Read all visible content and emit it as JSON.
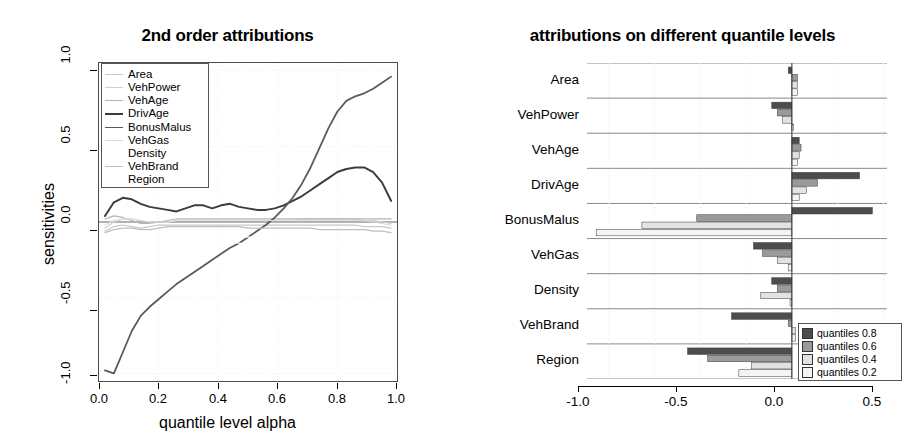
{
  "left": {
    "title": "2nd order attributions",
    "ylabel": "sensitivities",
    "xlabel": "quantile level alpha",
    "yticks": [
      "1.0",
      "0.5",
      "0.0",
      "-0.5",
      "-1.0"
    ],
    "xticks": [
      "0.0",
      "0.2",
      "0.4",
      "0.6",
      "0.8",
      "1.0"
    ],
    "legend": [
      {
        "label": "Area",
        "color": "#c8c8c8",
        "width": 1.2
      },
      {
        "label": "VehPower",
        "color": "#d2d2d2",
        "width": 1.2
      },
      {
        "label": "VehAge",
        "color": "#b4b4b4",
        "width": 1.2
      },
      {
        "label": "DrivAge",
        "color": "#3c3c3c",
        "width": 2.0
      },
      {
        "label": "BonusMalus",
        "color": "#5a5a5a",
        "width": 1.8
      },
      {
        "label": "VehGas",
        "color": "#dcdcdc",
        "width": 1.2
      },
      {
        "label": "Density",
        "color": "#ffffff",
        "width": 1.2
      },
      {
        "label": "VehBrand",
        "color": "#bebebe",
        "width": 1.2
      },
      {
        "label": "Region",
        "color": "#ffffff",
        "width": 1.2
      }
    ]
  },
  "right": {
    "title": "attributions on different quantile levels",
    "xticks": [
      "-1.0",
      "-0.5",
      "0.0",
      "0.5"
    ],
    "categories": [
      "Area",
      "VehPower",
      "VehAge",
      "DrivAge",
      "BonusMalus",
      "VehGas",
      "Density",
      "VehBrand",
      "Region"
    ],
    "legend": [
      {
        "label": "quantiles 0.8",
        "color": "#4d4d4d"
      },
      {
        "label": "quantiles 0.6",
        "color": "#9a9a9a"
      },
      {
        "label": "quantiles 0.4",
        "color": "#e2e2e2"
      },
      {
        "label": "quantiles 0.2",
        "color": "#f4f4f4"
      }
    ]
  },
  "chart_data": [
    {
      "type": "line",
      "title": "2nd order attributions",
      "xlabel": "quantile level alpha",
      "ylabel": "sensitivities",
      "xlim": [
        0.0,
        1.0
      ],
      "ylim": [
        -1.05,
        1.05
      ],
      "grid": true,
      "legend_position": "top-left",
      "x": [
        0.02,
        0.05,
        0.08,
        0.11,
        0.14,
        0.17,
        0.2,
        0.23,
        0.26,
        0.29,
        0.32,
        0.35,
        0.38,
        0.41,
        0.44,
        0.47,
        0.5,
        0.53,
        0.56,
        0.59,
        0.62,
        0.65,
        0.68,
        0.71,
        0.74,
        0.77,
        0.8,
        0.83,
        0.86,
        0.89,
        0.92,
        0.95,
        0.98
      ],
      "series": [
        {
          "name": "Area",
          "values": [
            -0.06,
            -0.03,
            -0.02,
            -0.03,
            -0.04,
            -0.03,
            -0.02,
            -0.02,
            -0.02,
            -0.02,
            -0.02,
            -0.02,
            -0.02,
            -0.02,
            -0.02,
            -0.02,
            -0.02,
            -0.02,
            -0.02,
            -0.02,
            -0.02,
            -0.02,
            -0.02,
            -0.02,
            -0.02,
            -0.02,
            -0.02,
            -0.02,
            -0.02,
            -0.03,
            -0.03,
            -0.03,
            -0.04
          ]
        },
        {
          "name": "VehPower",
          "values": [
            -0.04,
            0.0,
            0.02,
            0.02,
            0.01,
            0.0,
            0.0,
            0.0,
            0.01,
            0.01,
            0.01,
            0.01,
            0.01,
            0.01,
            0.01,
            0.01,
            0.01,
            0.01,
            0.01,
            0.01,
            0.01,
            0.01,
            0.02,
            0.02,
            0.02,
            0.02,
            0.02,
            0.02,
            0.02,
            0.01,
            0.01,
            0.0,
            -0.01
          ]
        },
        {
          "name": "VehAge",
          "values": [
            0.02,
            0.04,
            0.03,
            0.01,
            -0.01,
            -0.01,
            0.0,
            0.01,
            0.02,
            0.02,
            0.02,
            0.02,
            0.02,
            0.02,
            0.02,
            0.02,
            0.02,
            0.02,
            0.02,
            0.02,
            0.02,
            0.02,
            0.02,
            0.02,
            0.02,
            0.02,
            0.02,
            0.02,
            0.02,
            0.02,
            0.02,
            0.02,
            0.02
          ]
        },
        {
          "name": "DrivAge",
          "values": [
            0.04,
            0.13,
            0.16,
            0.15,
            0.12,
            0.1,
            0.09,
            0.08,
            0.07,
            0.09,
            0.11,
            0.11,
            0.09,
            0.11,
            0.12,
            0.1,
            0.09,
            0.08,
            0.08,
            0.09,
            0.11,
            0.14,
            0.17,
            0.21,
            0.25,
            0.29,
            0.33,
            0.35,
            0.36,
            0.36,
            0.33,
            0.26,
            0.14
          ]
        },
        {
          "name": "BonusMalus",
          "values": [
            -0.98,
            -1.0,
            -0.86,
            -0.72,
            -0.62,
            -0.56,
            -0.51,
            -0.46,
            -0.41,
            -0.37,
            -0.33,
            -0.29,
            -0.25,
            -0.21,
            -0.17,
            -0.14,
            -0.1,
            -0.06,
            -0.02,
            0.03,
            0.09,
            0.16,
            0.25,
            0.36,
            0.49,
            0.62,
            0.73,
            0.8,
            0.83,
            0.85,
            0.88,
            0.92,
            0.96
          ]
        },
        {
          "name": "VehGas",
          "values": [
            -0.02,
            0.01,
            0.02,
            0.02,
            0.01,
            0.0,
            0.0,
            0.0,
            0.01,
            0.01,
            0.01,
            0.01,
            0.01,
            0.01,
            0.01,
            0.01,
            0.01,
            0.01,
            0.01,
            0.01,
            0.01,
            0.01,
            0.01,
            0.01,
            0.01,
            0.01,
            0.01,
            0.01,
            0.01,
            0.01,
            0.0,
            -0.01,
            -0.02
          ]
        },
        {
          "name": "Density",
          "values": [
            -0.08,
            -0.06,
            -0.06,
            -0.07,
            -0.08,
            -0.08,
            -0.08,
            -0.07,
            -0.07,
            -0.07,
            -0.07,
            -0.08,
            -0.09,
            -0.09,
            -0.09,
            -0.09,
            -0.1,
            -0.1,
            -0.1,
            -0.11,
            -0.12,
            -0.13,
            -0.14,
            -0.15,
            -0.16,
            -0.17,
            -0.17,
            -0.17,
            -0.17,
            -0.16,
            -0.15,
            -0.14,
            -0.13
          ]
        },
        {
          "name": "VehBrand",
          "values": [
            -0.07,
            -0.05,
            -0.04,
            -0.04,
            -0.05,
            -0.05,
            -0.04,
            -0.03,
            -0.03,
            -0.03,
            -0.03,
            -0.03,
            -0.03,
            -0.03,
            -0.03,
            -0.03,
            -0.04,
            -0.04,
            -0.04,
            -0.04,
            -0.04,
            -0.04,
            -0.04,
            -0.04,
            -0.05,
            -0.05,
            -0.05,
            -0.05,
            -0.05,
            -0.05,
            -0.06,
            -0.06,
            -0.07
          ]
        },
        {
          "name": "Region",
          "values": [
            -0.15,
            -0.1,
            -0.07,
            -0.06,
            -0.06,
            -0.07,
            -0.08,
            -0.09,
            -0.1,
            -0.1,
            -0.11,
            -0.12,
            -0.12,
            -0.12,
            -0.13,
            -0.14,
            -0.15,
            -0.16,
            -0.17,
            -0.18,
            -0.19,
            -0.2,
            -0.22,
            -0.25,
            -0.29,
            -0.34,
            -0.39,
            -0.43,
            -0.45,
            -0.46,
            -0.47,
            -0.48,
            -0.49
          ]
        }
      ]
    },
    {
      "type": "bar",
      "orientation": "horizontal",
      "title": "attributions on different quantile levels",
      "xlabel": "",
      "ylabel": "",
      "xlim": [
        -1.12,
        0.52
      ],
      "grid": true,
      "legend_position": "bottom-right",
      "categories": [
        "Area",
        "VehPower",
        "VehAge",
        "DrivAge",
        "BonusMalus",
        "VehGas",
        "Density",
        "VehBrand",
        "Region"
      ],
      "series": [
        {
          "name": "quantiles 0.8",
          "values": [
            -0.02,
            -0.11,
            0.04,
            0.37,
            0.44,
            -0.21,
            -0.11,
            -0.33,
            -0.57
          ]
        },
        {
          "name": "quantiles 0.6",
          "values": [
            0.03,
            -0.08,
            0.05,
            0.14,
            -0.52,
            -0.16,
            -0.08,
            -0.02,
            -0.46
          ]
        },
        {
          "name": "quantiles 0.4",
          "values": [
            0.03,
            -0.05,
            0.04,
            0.08,
            -0.82,
            -0.08,
            -0.17,
            0.02,
            -0.22
          ]
        },
        {
          "name": "quantiles 0.2",
          "values": [
            0.03,
            0.01,
            0.03,
            0.04,
            -1.07,
            -0.02,
            -0.01,
            0.02,
            -0.29
          ]
        }
      ]
    }
  ]
}
